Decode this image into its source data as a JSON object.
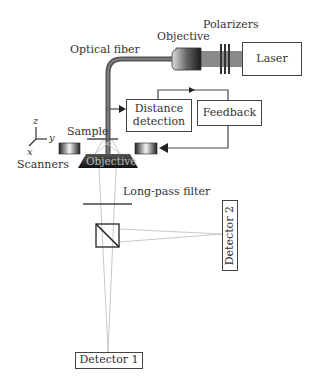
{
  "diagram": {
    "components": {
      "laser": "Laser",
      "polarizers": "Polarizers",
      "objective_top": "Objective",
      "optical_fiber": "Optical fiber",
      "distance_detection": [
        "Distance",
        "detection"
      ],
      "feedback": "Feedback",
      "sample": "Sample",
      "scanners": "Scanners",
      "objective_bottom": "Objective",
      "long_pass_filter": "Long-pass filter",
      "detector_1": "Detector 1",
      "detector_2": "Detector 2"
    },
    "axes": {
      "z": "z",
      "y": "y",
      "x": "x"
    },
    "colors": {
      "line": "#444444",
      "beam": "#c8c8c8",
      "fiber": "#555555",
      "dark_component": "#2b2b2b"
    }
  }
}
